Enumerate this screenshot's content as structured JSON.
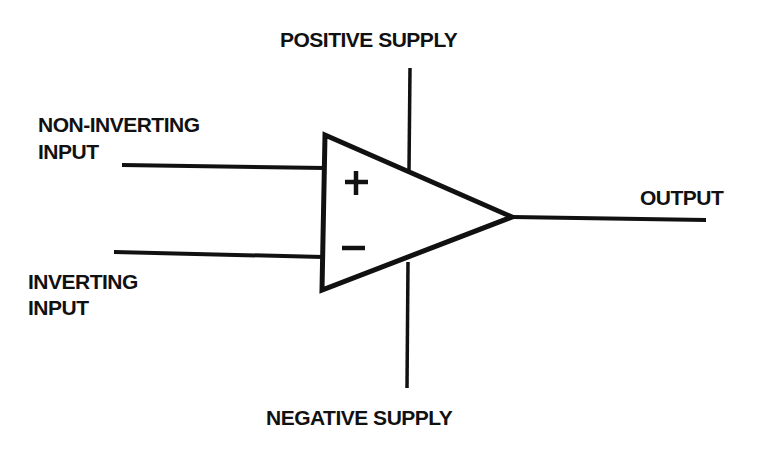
{
  "diagram": {
    "stroke_color": "#111111",
    "background": "#ffffff",
    "labels": {
      "positive_supply": "POSITIVE SUPPLY",
      "negative_supply": "NEGATIVE SUPPLY",
      "non_inverting_line1": "NON-INVERTING",
      "non_inverting_line2": "INPUT",
      "inverting_line1": "INVERTING",
      "inverting_line2": "INPUT",
      "output": "OUTPUT"
    },
    "symbols": {
      "plus": "+",
      "minus": "−"
    }
  }
}
